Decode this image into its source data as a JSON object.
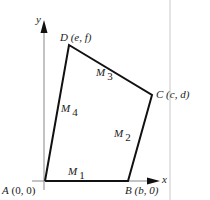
{
  "diagram": {
    "type": "quadrilateral-on-coordinate-axes",
    "axes": {
      "x_label": "x",
      "y_label": "y"
    },
    "vertices": [
      {
        "name": "A",
        "coords": "(0, 0)"
      },
      {
        "name": "B",
        "coords": "(b, 0)"
      },
      {
        "name": "C",
        "coords": "(c, d)"
      },
      {
        "name": "D",
        "coords": "(e, f)"
      }
    ],
    "midpoints": [
      {
        "name": "M",
        "index": "1",
        "side": "AB"
      },
      {
        "name": "M",
        "index": "2",
        "side": "BC"
      },
      {
        "name": "M",
        "index": "3",
        "side": "CD"
      },
      {
        "name": "M",
        "index": "4",
        "side": "DA"
      }
    ],
    "colors": {
      "shape_stroke": "#111111",
      "axis_stroke": "#888888",
      "divider": "#e4e4e4"
    }
  }
}
